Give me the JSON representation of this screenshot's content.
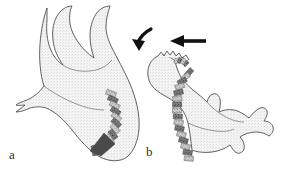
{
  "figure": {
    "type": "anatomical-line-drawing",
    "background_color": "#ffffff",
    "outline_color": "#4a4a4a",
    "body_fill_color": "#f2f2f2",
    "body_stipple_color": "#d8d8d8",
    "spine_dark_color": "#5a5a5a",
    "spine_light_color": "#b9b9b9",
    "arrow_color": "#101010",
    "panels": [
      {
        "id": "a",
        "label": "a",
        "description": "Infant body in flexed posture, viewed from the side, head at lower right; spinal column shown as a chain of hatched vertebral segments curving along the back toward the lower right.",
        "spine_segment_count": 12,
        "arrows": []
      },
      {
        "id": "b",
        "label": "b",
        "description": "Infant body in extended posture with head thrown back at upper left; spinal column shown as a chain of hatched vertebral segments curving down from the neck; two arrows above the head indicate applied force and resulting head motion.",
        "spine_segment_count": 15,
        "arrows": [
          {
            "name": "curved-rotation-arrow",
            "style": "curved",
            "direction": "down-left",
            "meaning": "head rotation / recoil"
          },
          {
            "name": "straight-force-arrow",
            "style": "straight",
            "direction": "left",
            "meaning": "applied force"
          }
        ]
      }
    ]
  }
}
